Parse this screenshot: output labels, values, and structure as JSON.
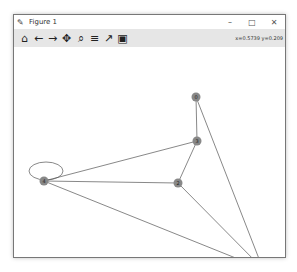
{
  "window": {
    "title": "Figure 1",
    "controls": [
      "minimize",
      "maximize",
      "close"
    ],
    "control_glyphs": [
      "–",
      "□",
      "✕"
    ]
  },
  "toolbar": {
    "buttons": [
      {
        "name": "home",
        "glyph": "⌂"
      },
      {
        "name": "back",
        "glyph": "←"
      },
      {
        "name": "forward",
        "glyph": "→"
      },
      {
        "name": "pan",
        "glyph": "✥"
      },
      {
        "name": "zoom",
        "glyph": "⌕"
      },
      {
        "name": "configure-subplots",
        "glyph": "≡"
      },
      {
        "name": "edit-axis",
        "glyph": "↗"
      },
      {
        "name": "save",
        "glyph": "▣"
      }
    ],
    "coordinates": "x=0.5739 y=0.209"
  },
  "graph": {
    "nodes": [
      {
        "id": "0",
        "x": 182,
        "y": 50
      },
      {
        "id": "1",
        "x": 249,
        "y": 222
      },
      {
        "id": "2",
        "x": 164,
        "y": 136
      },
      {
        "id": "3",
        "x": 183,
        "y": 94
      },
      {
        "id": "4",
        "x": 30,
        "y": 134
      }
    ],
    "edges": [
      [
        "0",
        "3"
      ],
      [
        "0",
        "1"
      ],
      [
        "3",
        "2"
      ],
      [
        "3",
        "4"
      ],
      [
        "2",
        "4"
      ],
      [
        "2",
        "1"
      ],
      [
        "4",
        "1"
      ],
      [
        "4",
        "4"
      ]
    ],
    "node_color": "#888888",
    "edge_color": "#555555"
  }
}
